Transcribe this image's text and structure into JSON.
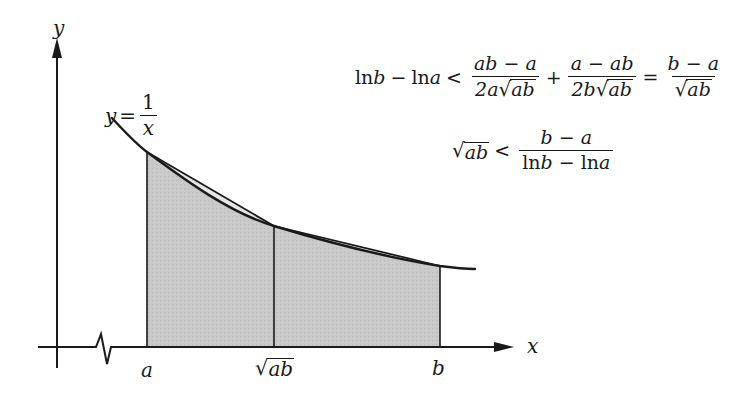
{
  "diagram": {
    "type": "function-area-comparison",
    "colors": {
      "stroke": "#1a1a1a",
      "fill": "#c8c8c8",
      "background": "#ffffff"
    },
    "axes": {
      "x_label": "x",
      "y_label": "y",
      "x_axis_break": true
    },
    "curve_label": {
      "lhs": "y",
      "eq": "=",
      "num": "1",
      "den": "x"
    },
    "x_ticks": [
      {
        "label": "a",
        "kind": "plain"
      },
      {
        "label": "ab",
        "kind": "sqrt"
      },
      {
        "label": "b",
        "kind": "plain"
      }
    ]
  },
  "equations": {
    "line1": {
      "lhs_ln1": "ln",
      "lhs_var1": "b",
      "lhs_minus": "−",
      "lhs_ln2": "ln",
      "lhs_var2": "a",
      "lt": "<",
      "frac1_num": "ab − a",
      "frac1_den_pre": "2a",
      "frac1_den_rad": "ab",
      "plus": "+",
      "frac2_num": "a − ab",
      "frac2_den_pre": "2b",
      "frac2_den_rad": "ab",
      "eq": "=",
      "frac3_num": "b − a",
      "frac3_den_rad": "ab"
    },
    "line2": {
      "lhs_rad": "ab",
      "lt": "<",
      "frac_num": "b − a",
      "frac_den_ln1": "ln",
      "frac_den_var1": "b",
      "frac_den_minus": " − ",
      "frac_den_ln2": "ln",
      "frac_den_var2": "a"
    }
  }
}
